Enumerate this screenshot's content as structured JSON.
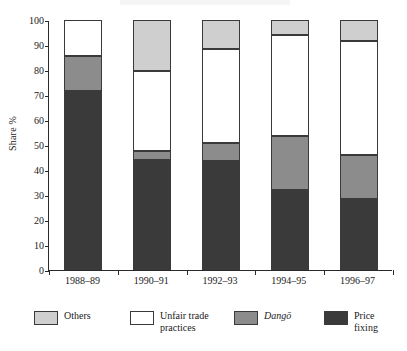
{
  "chart_data": {
    "type": "bar",
    "subtype": "stacked-bar-100",
    "title": "",
    "xlabel": "",
    "ylabel": "Share %",
    "ylim": [
      0,
      100
    ],
    "ytick_step": 10,
    "yticks": [
      0,
      10,
      20,
      30,
      40,
      50,
      60,
      70,
      80,
      90,
      100
    ],
    "ytick_labels": [
      "0",
      "10",
      "20",
      "30",
      "40",
      "50",
      "60",
      "70",
      "80",
      "90",
      "100"
    ],
    "grid": false,
    "legend_position": "bottom",
    "categories": [
      "1988–89",
      "1990–91",
      "1992–93",
      "1994–95",
      "1996–97"
    ],
    "series": [
      {
        "name": "Price fixing",
        "color": "#3a3a3a",
        "values": [
          71.5,
          44.0,
          43.5,
          32.0,
          28.5
        ]
      },
      {
        "name": "Dangō",
        "color": "#8c8c8c",
        "italic": true,
        "values": [
          14.0,
          3.5,
          7.5,
          21.5,
          17.5
        ]
      },
      {
        "name": "Unfair trade practices",
        "color": "#ffffff",
        "values": [
          14.5,
          32.0,
          37.5,
          40.5,
          45.5
        ]
      },
      {
        "name": "Others",
        "color": "#cfcfcf",
        "values": [
          0.0,
          20.5,
          11.5,
          6.0,
          8.5
        ]
      }
    ],
    "cumulative_tops": {
      "1988–89": {
        "price_fixing": 71.5,
        "dango": 85.5,
        "unfair_trade_practices": 100.0,
        "others": 100.0
      },
      "1990–91": {
        "price_fixing": 44.0,
        "dango": 47.5,
        "unfair_trade_practices": 79.5,
        "others": 100.0
      },
      "1992–93": {
        "price_fixing": 43.5,
        "dango": 51.0,
        "unfair_trade_practices": 88.5,
        "others": 100.0
      },
      "1994–95": {
        "price_fixing": 32.0,
        "dango": 53.5,
        "unfair_trade_practices": 94.0,
        "others": 100.0
      },
      "1996–97": {
        "price_fixing": 28.5,
        "dango": 46.0,
        "unfair_trade_practices": 91.5,
        "others": 100.0
      }
    },
    "legend_entries": [
      {
        "label": "Others",
        "color": "#cfcfcf"
      },
      {
        "label": "Unfair trade\npractices",
        "color": "#ffffff"
      },
      {
        "label": "Dangō",
        "color": "#8c8c8c"
      },
      {
        "label": "Price\nfixing",
        "color": "#3a3a3a"
      }
    ]
  },
  "colors": {
    "axis": "#2a2a2a",
    "text": "#1a1a1a",
    "background": "#ffffff",
    "others": "#cfcfcf",
    "unfair_trade_practices": "#ffffff",
    "dango": "#8c8c8c",
    "price_fixing": "#3a3a3a"
  }
}
